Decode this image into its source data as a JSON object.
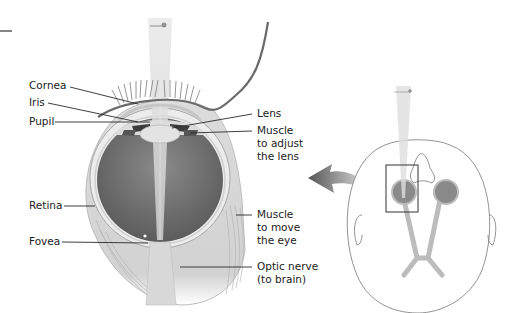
{
  "labels_left": {
    "cornea": "Cornea",
    "iris": "Iris",
    "pupil": "Pupil",
    "retina": "Retina",
    "fovea": "Fovea"
  },
  "labels_right": {
    "lens": "Lens",
    "muscle_lens": "Muscle\nto adjust\nthe lens",
    "muscle_eye": "Muscle\nto move\nthe eye",
    "optic_nerve": "Optic nerve\n(to brain)"
  },
  "colors": {
    "line": "#2a2a2a",
    "tissue_light": "#e6e6e6",
    "tissue_mid": "#c9c9c9",
    "vitreous": "#6e6e6e",
    "light_beam": "#d8d8d8"
  }
}
